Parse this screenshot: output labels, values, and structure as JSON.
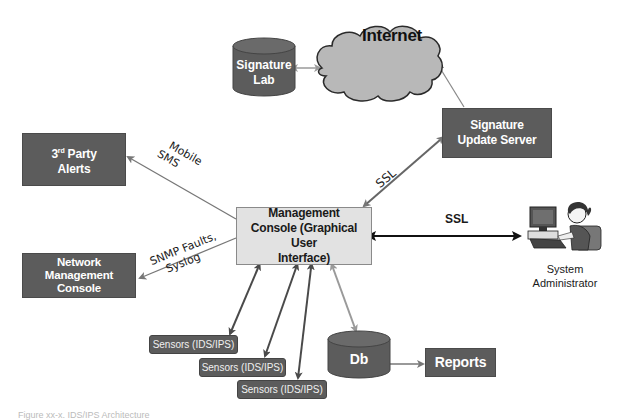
{
  "diagram": {
    "title": "IDS/IPS Architecture",
    "caption": "Figure xx-x. IDS/IPS Architecture",
    "colors": {
      "dark_box": "#5c5c5c",
      "console_fill": "#e2e2e2",
      "cloud_fill": "#b8b8b8",
      "dark_arrow": "#4a4a4a",
      "light_arrow": "#9a9a9a",
      "black_arrow": "#111111"
    },
    "nodes": {
      "signature_lab": {
        "line1": "Signature",
        "line2": "Lab",
        "shape": "cylinder"
      },
      "internet": {
        "label": "Internet",
        "shape": "cloud"
      },
      "signature_update_server": {
        "line1": "Signature",
        "line2": "Update Server",
        "shape": "rectangle"
      },
      "third_party_alerts": {
        "line1_prefix": "3",
        "line1_sup": "rd",
        "line1_suffix": " Party",
        "line2": "Alerts",
        "shape": "rectangle"
      },
      "network_management_console": {
        "line1": "Network",
        "line2": "Management",
        "line3": "Console",
        "shape": "rectangle"
      },
      "management_console": {
        "line1": "Management",
        "line2": "Console (Graphical User",
        "line3": "Interface)",
        "shape": "rectangle"
      },
      "system_administrator": {
        "line1": "System",
        "line2": "Administrator",
        "icon": "person-at-computer-icon"
      },
      "sensors": [
        {
          "label": "Sensors (IDS/IPS)"
        },
        {
          "label": "Sensors (IDS/IPS)"
        },
        {
          "label": "Sensors (IDS/IPS)"
        }
      ],
      "db": {
        "label": "Db",
        "shape": "cylinder"
      },
      "reports": {
        "label": "Reports",
        "shape": "rectangle"
      }
    },
    "edges": [
      {
        "from": "signature_lab",
        "to": "internet",
        "direction": "both",
        "label": ""
      },
      {
        "from": "internet",
        "to": "signature_update_server",
        "direction": "both",
        "label": ""
      },
      {
        "from": "signature_update_server",
        "to": "management_console",
        "direction": "both",
        "label": "SSL"
      },
      {
        "from": "management_console",
        "to": "third_party_alerts",
        "direction": "forward",
        "label": "Mobile SMS"
      },
      {
        "from": "management_console",
        "to": "network_management_console",
        "direction": "forward",
        "label": "SNMP Faults, Syslog"
      },
      {
        "from": "management_console",
        "to": "system_administrator",
        "direction": "both",
        "label": "SSL"
      },
      {
        "from": "management_console",
        "to": "sensors.0",
        "direction": "both",
        "label": ""
      },
      {
        "from": "management_console",
        "to": "sensors.1",
        "direction": "both",
        "label": ""
      },
      {
        "from": "management_console",
        "to": "sensors.2",
        "direction": "both",
        "label": ""
      },
      {
        "from": "management_console",
        "to": "db",
        "direction": "both",
        "label": ""
      },
      {
        "from": "db",
        "to": "reports",
        "direction": "forward",
        "label": ""
      }
    ],
    "edge_labels": {
      "mobile_line1": "Mobile",
      "mobile_line2": "SMS",
      "snmp_line1": "SNMP Faults,",
      "snmp_line2": "Syslog",
      "ssl_diagonal": "SSL",
      "ssl_admin": "SSL"
    }
  }
}
